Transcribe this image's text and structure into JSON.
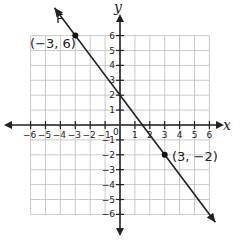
{
  "chart_data": {
    "type": "line",
    "title": "",
    "xlabel": "x",
    "ylabel": "y",
    "xlim": [
      -6,
      6
    ],
    "ylim": [
      -6,
      6
    ],
    "grid": true,
    "x_ticks": [
      "-6",
      "-5",
      "-4",
      "-3",
      "-2",
      "-1",
      "1",
      "2",
      "3",
      "4",
      "5",
      "6"
    ],
    "y_ticks": [
      "6",
      "5",
      "4",
      "3",
      "2",
      "1",
      "-1",
      "-2",
      "-3",
      "-4",
      "-5",
      "-6"
    ],
    "origin_label": "0",
    "series": [
      {
        "name": "F",
        "points": [
          {
            "x": -3,
            "y": 6
          },
          {
            "x": 3,
            "y": -2
          }
        ],
        "slope": -1.3333,
        "y_intercept": 2,
        "color": "#222222"
      }
    ],
    "annotations": [
      {
        "text": "(−3, 6)",
        "x": -3,
        "y": 6
      },
      {
        "text": "(3, −2)",
        "x": 3,
        "y": -2
      },
      {
        "text": "F",
        "label_for": "line"
      }
    ]
  },
  "labels": {
    "line_name": "F",
    "point1": "(−3, 6)",
    "point2": "(3, −2)",
    "x_axis": "x",
    "y_axis": "y",
    "origin": "0"
  }
}
